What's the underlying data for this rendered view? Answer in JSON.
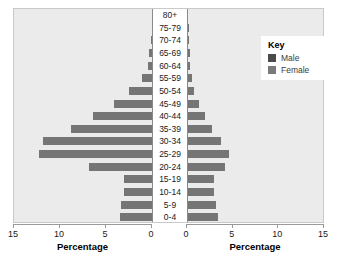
{
  "legend": {
    "title": "Key",
    "items": [
      {
        "label": "Male",
        "color": "#4a4a4a"
      },
      {
        "label": "Female",
        "color": "#7a7a7a"
      }
    ]
  },
  "axes": {
    "left": {
      "title": "Percentage",
      "ticks": [
        "15",
        "10",
        "5",
        "0"
      ],
      "min": 0,
      "max": 15
    },
    "right": {
      "title": "Percentage",
      "ticks": [
        "0",
        "5",
        "10",
        "15"
      ],
      "min": 0,
      "max": 15
    }
  },
  "chart_data": {
    "type": "bar",
    "title": "",
    "subtitle": "",
    "xlabel": "Percentage",
    "ylabel": "",
    "xlim": [
      0,
      15
    ],
    "grid": false,
    "legend_position": "top-right",
    "orientation": "population-pyramid",
    "categories": [
      "80+",
      "75-79",
      "70-74",
      "65-69",
      "60-64",
      "55-59",
      "50-54",
      "45-49",
      "40-44",
      "35-39",
      "30-34",
      "25-29",
      "20-24",
      "15-19",
      "10-14",
      "5-9",
      "0-4"
    ],
    "series": [
      {
        "name": "Male",
        "side": "left",
        "color": "#757575",
        "values": [
          0.0,
          0.05,
          0.1,
          0.3,
          0.4,
          1.1,
          2.5,
          4.1,
          6.4,
          8.8,
          11.8,
          12.3,
          6.8,
          3.0,
          3.0,
          3.4,
          3.5
        ]
      },
      {
        "name": "Female",
        "side": "right",
        "color": "#757575",
        "values": [
          0.0,
          0.05,
          0.1,
          0.2,
          0.2,
          0.4,
          0.7,
          1.2,
          1.9,
          2.6,
          3.6,
          4.5,
          4.0,
          2.8,
          2.9,
          3.1,
          3.3
        ]
      }
    ]
  }
}
